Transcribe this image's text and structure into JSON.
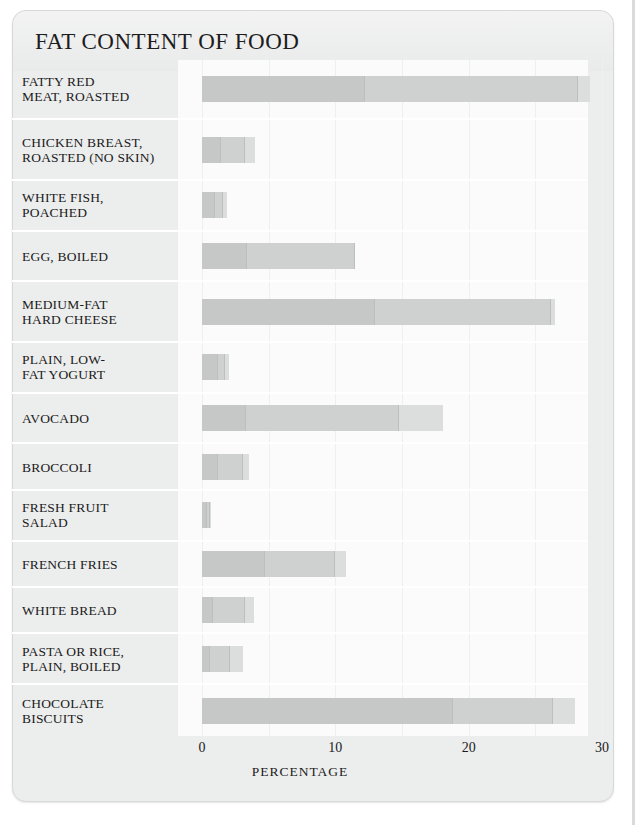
{
  "card": {
    "title": "FAT CONTENT OF FOOD"
  },
  "axis": {
    "ticks": [
      "0",
      "10",
      "20",
      "30"
    ],
    "tick_values": [
      0,
      10,
      20,
      30
    ],
    "xlabel": "PERCENTAGE"
  },
  "colors": {
    "card_bg": "#eceded",
    "plot_bg": "#fbfbfb",
    "segment_dark": "#c6c8c8",
    "segment_mid": "#cfd1d1",
    "segment_light": "#dcdede",
    "gridline": "#eef0f0",
    "text": "#1b1b1b"
  },
  "chart_data": {
    "type": "bar",
    "orientation": "horizontal",
    "stacked": true,
    "title": "FAT CONTENT OF FOOD",
    "xlabel": "PERCENTAGE",
    "ylabel": "",
    "xlim": [
      0,
      30
    ],
    "xticks": [
      0,
      10,
      20,
      30
    ],
    "grid": true,
    "grid_interval": 5,
    "legend": "none",
    "series": [
      {
        "name": "saturated fat",
        "values": [
          12.2,
          1.4,
          1.0,
          3.4,
          13.0,
          1.2,
          3.3,
          1.2,
          0.4,
          4.7,
          0.8,
          0.6,
          18.8
        ]
      },
      {
        "name": "unsaturated fat",
        "values": [
          16.0,
          1.8,
          0.6,
          8.1,
          13.2,
          0.5,
          11.5,
          1.9,
          0.2,
          5.3,
          2.4,
          1.5,
          7.5
        ]
      },
      {
        "name": "other fat",
        "values": [
          0.9,
          0.8,
          0.3,
          0.0,
          0.3,
          0.3,
          3.3,
          0.4,
          0.1,
          0.8,
          0.7,
          1.0,
          1.7
        ]
      }
    ],
    "categories": [
      "FATTY RED MEAT, ROASTED",
      "CHICKEN BREAST, ROASTED (NO SKIN)",
      "WHITE FISH, POACHED",
      "EGG, BOILED",
      "MEDIUM-FAT HARD CHEESE",
      "PLAIN, LOW-FAT YOGURT",
      "AVOCADO",
      "BROCCOLI",
      "FRESH FRUIT SALAD",
      "FRENCH FRIES",
      "WHITE BREAD",
      "PASTA OR RICE, PLAIN, BOILED",
      "CHOCOLATE BISCUITS"
    ],
    "totals": [
      29.1,
      4.0,
      1.9,
      11.5,
      26.5,
      2.0,
      18.1,
      3.5,
      0.7,
      10.8,
      3.9,
      3.1,
      28.0
    ]
  },
  "rows": [
    {
      "label_lines": [
        "FATTY RED",
        "MEAT, ROASTED"
      ],
      "segments": [
        12.2,
        16.0,
        0.9
      ],
      "total": 29.1
    },
    {
      "label_lines": [
        "CHICKEN BREAST,",
        "ROASTED (NO SKIN)"
      ],
      "segments": [
        1.4,
        1.8,
        0.8
      ],
      "total": 4.0
    },
    {
      "label_lines": [
        "WHITE FISH,",
        "POACHED"
      ],
      "segments": [
        1.0,
        0.6,
        0.3
      ],
      "total": 1.9
    },
    {
      "label_lines": [
        "EGG, BOILED"
      ],
      "segments": [
        3.4,
        8.1,
        0.0
      ],
      "total": 11.5
    },
    {
      "label_lines": [
        "MEDIUM-FAT",
        "HARD CHEESE"
      ],
      "segments": [
        13.0,
        13.2,
        0.3
      ],
      "total": 26.5
    },
    {
      "label_lines": [
        "PLAIN, LOW-",
        "FAT YOGURT"
      ],
      "segments": [
        1.2,
        0.5,
        0.3
      ],
      "total": 2.0
    },
    {
      "label_lines": [
        "AVOCADO"
      ],
      "segments": [
        3.3,
        11.5,
        3.3
      ],
      "total": 18.1
    },
    {
      "label_lines": [
        "BROCCOLI"
      ],
      "segments": [
        1.2,
        1.9,
        0.4
      ],
      "total": 3.5
    },
    {
      "label_lines": [
        "FRESH FRUIT",
        "SALAD"
      ],
      "segments": [
        0.4,
        0.2,
        0.1
      ],
      "total": 0.7
    },
    {
      "label_lines": [
        "FRENCH FRIES"
      ],
      "segments": [
        4.7,
        5.3,
        0.8
      ],
      "total": 10.8
    },
    {
      "label_lines": [
        "WHITE BREAD"
      ],
      "segments": [
        0.8,
        2.4,
        0.7
      ],
      "total": 3.9
    },
    {
      "label_lines": [
        "PASTA OR RICE,",
        "PLAIN, BOILED"
      ],
      "segments": [
        0.6,
        1.5,
        1.0
      ],
      "total": 3.1
    },
    {
      "label_lines": [
        "CHOCOLATE",
        "BISCUITS"
      ],
      "segments": [
        18.8,
        7.5,
        1.7
      ],
      "total": 28.0
    }
  ]
}
